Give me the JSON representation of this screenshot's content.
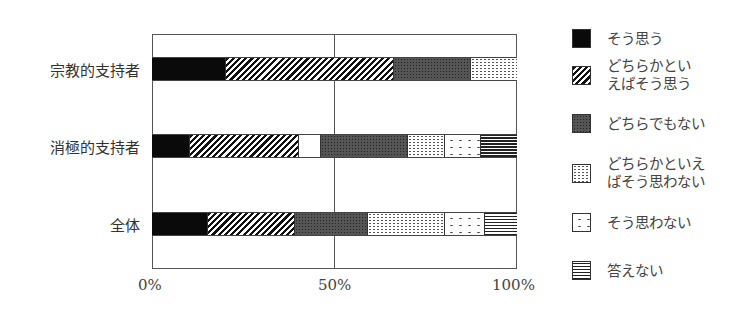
{
  "chart_data": {
    "type": "bar",
    "orientation": "horizontal",
    "stacked": true,
    "normalized_100": true,
    "title": "",
    "xlabel": "",
    "ylabel": "",
    "xlim": [
      0,
      100
    ],
    "x_ticks": [
      "0%",
      "50%",
      "100%"
    ],
    "grid": {
      "vertical_at": [
        50
      ]
    },
    "legend_position": "right",
    "categories": [
      "宗教的支持者",
      "消極的支持者",
      "全体"
    ],
    "series": [
      {
        "name": "そう思う",
        "pattern": "solid",
        "values": [
          20,
          10,
          15
        ]
      },
      {
        "name": "どちらかといえばそう思う",
        "pattern": "hatch",
        "values": [
          46,
          30,
          24
        ]
      },
      {
        "name": "(unlabeled blank)",
        "pattern": "white",
        "values": [
          0,
          6,
          0
        ]
      },
      {
        "name": "どちらでもない",
        "pattern": "dark",
        "values": [
          21,
          24,
          20
        ]
      },
      {
        "name": "どちらかといえばそう思わない",
        "pattern": "light",
        "values": [
          13,
          10,
          21
        ]
      },
      {
        "name": "そう思わない",
        "pattern": "sparse",
        "values": [
          0,
          10,
          11
        ]
      },
      {
        "name": "答えない",
        "pattern": "horiz",
        "values": [
          0,
          10,
          9
        ]
      }
    ]
  },
  "caption_clipped": "",
  "axis": {
    "tick_0": "0%",
    "tick_50": "50%",
    "tick_100": "100%"
  },
  "categories": {
    "c0": "宗教的支持者",
    "c1": "消極的支持者",
    "c2": "全体"
  },
  "legend": {
    "l0": {
      "line1": "そう思う",
      "line2": ""
    },
    "l1": {
      "line1": "どちらかとい",
      "line2": "えばそう思う"
    },
    "l2": {
      "line1": "どちらでもない",
      "line2": ""
    },
    "l3": {
      "line1": "どちらかといえ",
      "line2": "ばそう思わない"
    },
    "l4": {
      "line1": "そう思わない",
      "line2": ""
    },
    "l5": {
      "line1": "答えない",
      "line2": ""
    }
  }
}
